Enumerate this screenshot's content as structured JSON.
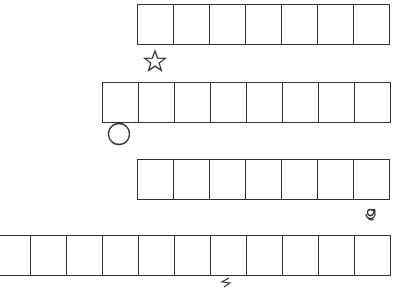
{
  "worksheet": {
    "strips": [
      {
        "id": "strip-1",
        "cells": 7,
        "left": 137,
        "top": 4,
        "symbol": "star-icon"
      },
      {
        "id": "strip-2",
        "cells": 8,
        "left": 102,
        "top": 82,
        "symbol": "circle-icon"
      },
      {
        "id": "strip-3",
        "cells": 7,
        "left": 137,
        "top": 159,
        "symbol": "spiral-icon"
      },
      {
        "id": "strip-4",
        "cells": 11,
        "left": -6,
        "top": 235,
        "symbol": "lightning-icon"
      }
    ],
    "stroke_color": "#333333",
    "background": "#ffffff"
  }
}
